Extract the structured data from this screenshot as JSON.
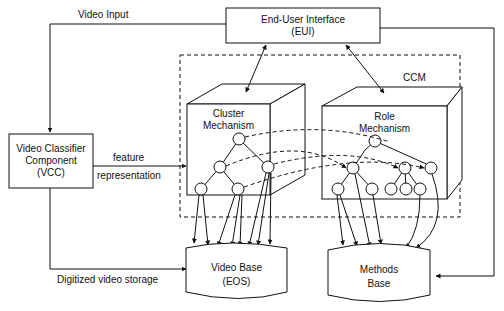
{
  "diagram": {
    "title_box": {
      "line1": "End-User Interface",
      "line2": "(EUI)"
    },
    "vcc_box": {
      "line1": "Video Classifier",
      "line2": "Component",
      "line3": "(VCC)"
    },
    "ccm_label": "CCM",
    "cluster_box": {
      "line1": "Cluster",
      "line2": "Mechanism"
    },
    "role_box": {
      "line1": "Role",
      "line2": "Mechanism"
    },
    "video_base": {
      "line1": "Video Base",
      "line2": "(EOS)"
    },
    "methods_base": {
      "line1": "Methods",
      "line2": "Base"
    },
    "edges": {
      "video_input": "Video Input",
      "feature": "feature",
      "representation": "representation",
      "digitized": "Digitized video storage"
    }
  }
}
